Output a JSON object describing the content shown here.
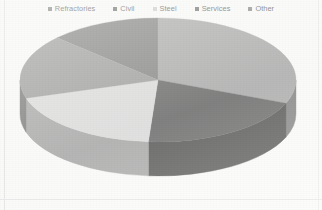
{
  "legend": {
    "position": "top",
    "items": [
      {
        "label": "Refractories",
        "color": "#6f6f6f",
        "marker": "square-marker"
      },
      {
        "label": "Civil",
        "color": "#5a5a5a",
        "marker": "square-marker"
      },
      {
        "label": "Steel",
        "color": "#c9c9c9",
        "marker": "square-marker"
      },
      {
        "label": "Services",
        "color": "#5e5e5e",
        "marker": "square-marker"
      },
      {
        "label": "Other",
        "color": "#7a7a7a",
        "marker": "square-marker"
      }
    ]
  },
  "chart_data": {
    "type": "pie",
    "title": "",
    "three_d": true,
    "grid": false,
    "legend_position": "top",
    "categories": [
      "Refractories",
      "Civil",
      "Steel",
      "Services",
      "Other"
    ],
    "values": [
      13,
      31,
      19,
      20,
      17
    ],
    "unit": "%",
    "colors": [
      "#6f6f6f",
      "#9e9e9e",
      "#d8d8d8",
      "#4f4f4f",
      "#8d8d8d"
    ],
    "side_colors": [
      "#4d4d4d",
      "#6e6e6e",
      "#9a9a9a",
      "#363636",
      "#636363"
    ],
    "start_angle_deg": 0,
    "direction": "clockwise",
    "slices": [
      {
        "label": "Refractories",
        "value": 13,
        "start_deg": 313,
        "end_deg": 360,
        "top_color": "#6f6f6f",
        "side_color": "#4d4d4d"
      },
      {
        "label": "Civil",
        "value": 31,
        "start_deg": 0,
        "end_deg": 112,
        "top_color": "#9e9e9e",
        "side_color": "#6e6e6e"
      },
      {
        "label": "Services",
        "value": 20,
        "start_deg": 112,
        "end_deg": 184,
        "top_color": "#4f4f4f",
        "side_color": "#363636"
      },
      {
        "label": "Steel",
        "value": 19,
        "start_deg": 184,
        "end_deg": 253,
        "top_color": "#d8d8d8",
        "side_color": "#9a9a9a"
      },
      {
        "label": "Other",
        "value": 17,
        "start_deg": 253,
        "end_deg": 313,
        "top_color": "#8d8d8d",
        "side_color": "#636363"
      }
    ],
    "xlabel": "",
    "ylabel": ""
  },
  "geometry": {
    "center_x": 158,
    "center_y": 80,
    "radius_x": 138,
    "radius_y": 62,
    "depth": 34
  }
}
